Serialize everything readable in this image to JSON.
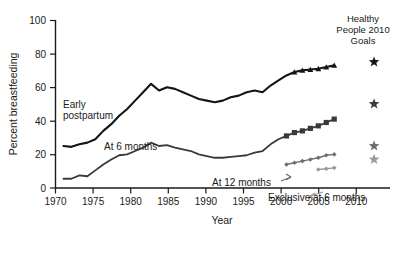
{
  "chart_data": {
    "type": "line",
    "title": "",
    "xlabel": "Year",
    "ylabel": "Percent breastfeeding",
    "xlim": [
      1970,
      2012
    ],
    "ylim": [
      0,
      100
    ],
    "xticks": [
      1970,
      1975,
      1980,
      1985,
      1990,
      1995,
      2000,
      2005,
      2010
    ],
    "yticks": [
      0,
      20,
      40,
      60,
      80,
      100
    ],
    "grid": false,
    "legend_position": "inline-annotations",
    "series": [
      {
        "name": "Early postpartum",
        "color": "#151515",
        "marker": "triangle",
        "marker_from_year": 2000,
        "x": [
          1971,
          1972,
          1973,
          1974,
          1975,
          1976,
          1977,
          1978,
          1979,
          1980,
          1981,
          1982,
          1983,
          1984,
          1985,
          1986,
          1987,
          1988,
          1989,
          1990,
          1991,
          1992,
          1993,
          1994,
          1995,
          1996,
          1997,
          1998,
          1999,
          2000,
          2001,
          2002,
          2003,
          2004,
          2005
        ],
        "values": [
          25,
          24.5,
          26,
          27,
          29,
          34,
          38,
          43,
          47,
          52,
          57,
          62,
          58,
          60,
          59,
          57,
          55,
          53,
          52,
          51,
          52,
          54,
          55,
          57,
          58,
          57,
          61,
          64,
          67,
          69,
          70,
          70.5,
          71,
          72,
          73
        ]
      },
      {
        "name": "At 6 months",
        "color": "#3a3a3a",
        "marker": "square",
        "marker_from_year": 1999,
        "x": [
          1971,
          1972,
          1973,
          1974,
          1975,
          1976,
          1977,
          1978,
          1979,
          1980,
          1981,
          1982,
          1983,
          1984,
          1985,
          1986,
          1987,
          1988,
          1989,
          1990,
          1991,
          1992,
          1993,
          1994,
          1995,
          1996,
          1997,
          1998,
          1999,
          2000,
          2001,
          2002,
          2003,
          2004,
          2005
        ],
        "values": [
          5.5,
          5.5,
          7.5,
          7,
          10.5,
          14,
          17,
          19.5,
          20,
          22,
          24,
          27,
          25,
          25.5,
          24,
          23,
          22,
          20,
          19,
          18,
          18,
          18.5,
          19,
          19.5,
          21,
          22,
          26,
          29,
          31,
          33,
          34,
          35.5,
          37,
          39,
          41
        ]
      },
      {
        "name": "At 12 months",
        "color": "#6e6e6e",
        "marker": "diamond",
        "marker_from_year": 1999,
        "x": [
          1999,
          2000,
          2001,
          2002,
          2003,
          2004,
          2005
        ],
        "values": [
          14,
          15,
          16,
          17,
          18,
          19.5,
          20
        ]
      },
      {
        "name": "Exclusive at 6 months",
        "color": "#9a9a9a",
        "marker": "diamond",
        "marker_from_year": 2003,
        "x": [
          2003,
          2004,
          2005
        ],
        "values": [
          11,
          11.5,
          12
        ]
      }
    ],
    "goals": {
      "label": "Healthy People 2010 Goals",
      "label_lines": [
        "Healthy",
        "People 2010",
        "Goals"
      ],
      "x": 2010,
      "markers": [
        {
          "series": "Early postpartum",
          "value": 75,
          "color": "#151515"
        },
        {
          "series": "At 6 months",
          "value": 50,
          "color": "#3a3a3a"
        },
        {
          "series": "At 12 months",
          "value": 25,
          "color": "#6e6e6e"
        },
        {
          "series": "Exclusive at 6 months",
          "value": 17,
          "color": "#9a9a9a"
        }
      ]
    },
    "annotations": [
      {
        "text": "Early",
        "x_px": 63,
        "y_px": 108
      },
      {
        "text": "postpartum",
        "x_px": 63,
        "y_px": 119
      },
      {
        "text": "At 6 months",
        "x_px": 104,
        "y_px": 150
      },
      {
        "text": "At 12 months",
        "x_px": 212,
        "y_px": 186
      },
      {
        "text": "Exclusive at 6 months",
        "x_px": 268,
        "y_px": 201
      }
    ]
  }
}
